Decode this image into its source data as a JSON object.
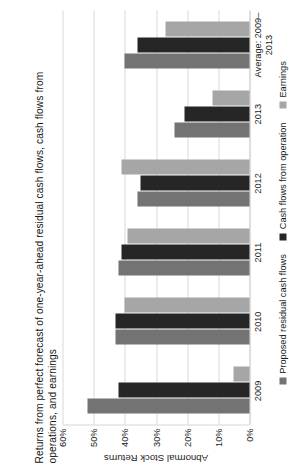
{
  "chart_data": {
    "type": "bar",
    "title": "Returns from perfect forecast of one-year-ahead residual cash flows, cash flows from operations, and earnings",
    "xlabel": "",
    "ylabel": "Abnormal Stock Returns",
    "ylim": [
      0,
      60
    ],
    "grid": true,
    "legend_position": "bottom",
    "tick_labels": [
      "60%",
      "50%",
      "40%",
      "30%",
      "20%",
      "10%",
      "0%"
    ],
    "tick_values": [
      60,
      50,
      40,
      30,
      20,
      10,
      0
    ],
    "categories": [
      "2009",
      "2010",
      "2011",
      "2012",
      "2013",
      "Average: 2009–\n2013"
    ],
    "series": [
      {
        "name": "Proposed residual cash flows",
        "color": "#737373",
        "values": [
          52,
          43,
          42,
          36,
          24,
          40
        ]
      },
      {
        "name": "Cash flows from operation",
        "color": "#262626",
        "values": [
          42,
          43,
          41,
          35,
          21,
          36
        ]
      },
      {
        "name": "Earnings",
        "color": "#a6a6a6",
        "values": [
          5,
          40,
          39,
          41,
          12,
          27
        ]
      }
    ]
  },
  "colors": {
    "gridline": "#d9d9d9",
    "axis": "#bdbdbd",
    "text": "#1a1a1a",
    "background": "#ffffff"
  }
}
